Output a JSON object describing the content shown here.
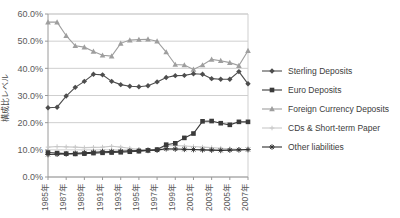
{
  "chart_data": {
    "type": "line",
    "title": "",
    "xlabel": "",
    "ylabel": "構成比レベル",
    "ylim": [
      0,
      60
    ],
    "ytick_labels": [
      "0.0%",
      "10.0%",
      "20.0%",
      "30.0%",
      "40.0%",
      "50.0%",
      "60.0%"
    ],
    "ytick_values": [
      0,
      10,
      20,
      30,
      40,
      50,
      60
    ],
    "grid": true,
    "legend_position": "right",
    "x": [
      1985,
      1986,
      1987,
      1988,
      1989,
      1990,
      1991,
      1992,
      1993,
      1994,
      1995,
      1996,
      1997,
      1998,
      1999,
      2000,
      2001,
      2002,
      2003,
      2004,
      2005,
      2006,
      2007
    ],
    "xtick_labels": [
      "1985年",
      "1987年",
      "1989年",
      "1991年",
      "1993年",
      "1995年",
      "1997年",
      "1999年",
      "2001年",
      "2003年",
      "2005年",
      "2007年"
    ],
    "xtick_values": [
      1985,
      1987,
      1989,
      1991,
      1993,
      1995,
      1997,
      1999,
      2001,
      2003,
      2005,
      2007
    ],
    "series": [
      {
        "name": "Sterling Deposits",
        "marker": "diamond",
        "color": "#4d4d4d",
        "values": [
          25.5,
          25.7,
          29.8,
          33.0,
          35.2,
          37.8,
          37.6,
          35.2,
          34.0,
          33.4,
          33.2,
          33.6,
          35.0,
          36.6,
          37.3,
          37.4,
          38.0,
          37.8,
          36.2,
          36.0,
          36.0,
          38.8,
          34.3
        ]
      },
      {
        "name": "Euro Deposits",
        "marker": "square",
        "color": "#3a3a3a",
        "values": [
          9.0,
          8.8,
          8.6,
          8.5,
          8.6,
          8.8,
          8.9,
          9.0,
          9.1,
          9.3,
          9.5,
          9.8,
          10.1,
          11.9,
          12.4,
          14.4,
          16.0,
          20.5,
          20.6,
          19.8,
          19.2,
          20.3,
          20.3
        ]
      },
      {
        "name": "Foreign Currency Deposits",
        "marker": "triangle",
        "color": "#9e9e9e",
        "values": [
          57.0,
          57.0,
          52.0,
          48.3,
          47.8,
          46.2,
          44.8,
          44.5,
          49.2,
          50.4,
          50.6,
          50.7,
          50.0,
          46.0,
          41.4,
          41.2,
          39.6,
          41.2,
          43.3,
          42.8,
          42.1,
          41.0,
          46.5
        ]
      },
      {
        "name": "CDs & Short-term Paper",
        "marker": "cross",
        "color": "#c8c8c8",
        "values": [
          11.0,
          11.2,
          11.1,
          11.0,
          10.8,
          10.9,
          11.0,
          11.3,
          11.0,
          10.6,
          10.2,
          10.0,
          10.0,
          11.5,
          11.6,
          11.4,
          11.2,
          11.0,
          10.8,
          10.6,
          10.4,
          10.2,
          10.0
        ]
      },
      {
        "name": "Other liabilities",
        "marker": "asterisk",
        "color": "#2e2e2e",
        "values": [
          8.3,
          8.4,
          8.5,
          8.7,
          8.9,
          9.1,
          9.3,
          9.4,
          9.5,
          9.6,
          9.7,
          9.8,
          9.9,
          10.4,
          10.3,
          10.2,
          10.1,
          10.0,
          9.9,
          9.8,
          9.9,
          10.0,
          10.1
        ]
      }
    ]
  }
}
